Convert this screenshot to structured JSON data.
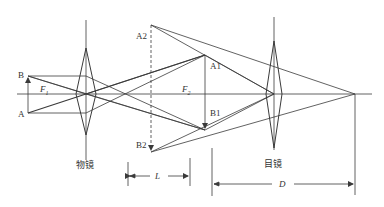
{
  "diagram": {
    "type": "optical-ray-diagram",
    "colors": {
      "line": "#3a3a3a",
      "background": "#ffffff"
    },
    "labels": {
      "B": "B",
      "A": "A",
      "F1": "F",
      "F1_sub": "1",
      "F2": "F",
      "F2_sub": "2",
      "A1": "A1",
      "B1": "B1",
      "A2": "A2",
      "B2": "B2",
      "objective": "物镜",
      "eyepiece": "目镜",
      "L": "L",
      "D": "D"
    },
    "elements": [
      {
        "id": "objective-lens",
        "label": "物镜",
        "type": "convex-lens",
        "x": 86
      },
      {
        "id": "eyepiece-lens",
        "label": "目镜",
        "type": "convex-lens",
        "x": 274
      },
      {
        "id": "object-AB",
        "type": "arrow",
        "from": "A",
        "to": "B"
      },
      {
        "id": "real-image-A1B1",
        "type": "arrow",
        "from": "A1",
        "to": "B1"
      },
      {
        "id": "virtual-image-A2B2",
        "type": "dashed-arrow",
        "from": "A2",
        "to": "B2"
      },
      {
        "id": "dimension-L",
        "label": "L",
        "type": "dimension"
      },
      {
        "id": "dimension-D",
        "label": "D",
        "type": "dimension"
      }
    ]
  }
}
